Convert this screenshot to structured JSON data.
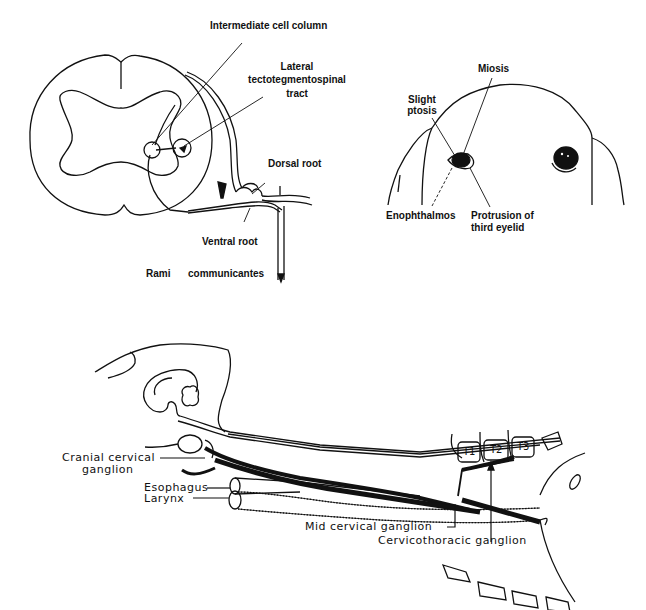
{
  "figure": {
    "panel_a": {
      "title": "Spinal cord cross-section",
      "labels": {
        "intermediate_cell_column": "Intermediate cell column",
        "lateral_tract_line1": "Lateral",
        "lateral_tract_line2": "tectotegmentospinal",
        "lateral_tract_line3": "tract",
        "dorsal_root": "Dorsal root",
        "ventral_root": "Ventral root",
        "rami_word1": "Rami",
        "rami_word2": "communicantes"
      }
    },
    "panel_b": {
      "title": "Horner's syndrome signs (face)",
      "labels": {
        "miosis": "Miosis",
        "slight_ptosis_line1": "Slight",
        "slight_ptosis_line2": "ptosis",
        "enophthalmos": "Enophthalmos",
        "protrusion_line1": "Protrusion of",
        "protrusion_line2": "third eyelid"
      }
    },
    "panel_c": {
      "title": "Sympathetic pathway to head (lateral view)",
      "labels": {
        "cranial_cervical_line1": "Cranial cervical",
        "cranial_cervical_line2": "ganglion",
        "esophagus": "Esophagus",
        "larynx": "Larynx",
        "mid_cervical": "Mid cervical ganglion",
        "cervicothoracic": "Cervicothoracic ganglion"
      },
      "vertebrae": [
        "T1",
        "T2",
        "T3"
      ]
    }
  }
}
